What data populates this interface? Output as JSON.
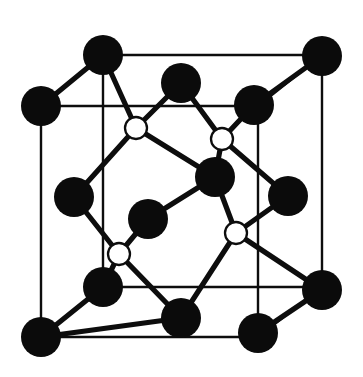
{
  "figure": {
    "background_color": "#ffffff",
    "line_color": "#0d0d0d",
    "dark_atom_color": "#0b0b0b",
    "light_atom_color": "#ffffff"
  },
  "geometry": {
    "canvas": {
      "width": 363,
      "height": 377
    },
    "cube_vertices": {
      "front_top_left": {
        "x": 41,
        "y": 106
      },
      "front_top_right": {
        "x": 258,
        "y": 106
      },
      "front_bottom_left": {
        "x": 41,
        "y": 337
      },
      "front_bottom_right": {
        "x": 258,
        "y": 337
      },
      "back_top_left": {
        "x": 103,
        "y": 55
      },
      "back_top_right": {
        "x": 322,
        "y": 55
      },
      "back_bottom_left": {
        "x": 103,
        "y": 287
      },
      "back_bottom_right": {
        "x": 322,
        "y": 287
      }
    },
    "dark_atoms": [
      {
        "name": "corner-back-top-left",
        "x": 103,
        "y": 55,
        "r": 20
      },
      {
        "name": "corner-back-top-right",
        "x": 322,
        "y": 56,
        "r": 20
      },
      {
        "name": "corner-front-top-left",
        "x": 41,
        "y": 106,
        "r": 20
      },
      {
        "name": "corner-front-bottom-left",
        "x": 41,
        "y": 337,
        "r": 20
      },
      {
        "name": "corner-back-bottom-left",
        "x": 103,
        "y": 287,
        "r": 20
      },
      {
        "name": "corner-back-bottom-right",
        "x": 322,
        "y": 290,
        "r": 20
      },
      {
        "name": "corner-front-bottom-right",
        "x": 258,
        "y": 333,
        "r": 20
      },
      {
        "name": "face-top-center",
        "x": 181,
        "y": 83,
        "r": 20
      },
      {
        "name": "face-top-right",
        "x": 254,
        "y": 105,
        "r": 20
      },
      {
        "name": "face-left-center",
        "x": 74,
        "y": 197,
        "r": 20
      },
      {
        "name": "face-right-center",
        "x": 288,
        "y": 196,
        "r": 20
      },
      {
        "name": "face-front-center",
        "x": 148,
        "y": 219,
        "r": 20
      },
      {
        "name": "face-back-center",
        "x": 215,
        "y": 177,
        "r": 20
      },
      {
        "name": "face-bottom-center",
        "x": 181,
        "y": 318,
        "r": 20
      }
    ],
    "light_atoms": [
      {
        "name": "interior-upper-left",
        "x": 136,
        "y": 128,
        "r": 11
      },
      {
        "name": "interior-upper-right",
        "x": 222,
        "y": 139,
        "r": 11
      },
      {
        "name": "interior-lower-left",
        "x": 119,
        "y": 254,
        "r": 11
      },
      {
        "name": "interior-lower-right",
        "x": 236,
        "y": 233,
        "r": 11
      }
    ],
    "bonds": [
      {
        "from": "interior-upper-left",
        "to": "corner-back-top-left"
      },
      {
        "from": "interior-upper-left",
        "to": "face-top-center"
      },
      {
        "from": "interior-upper-left",
        "to": "face-left-center"
      },
      {
        "from": "interior-upper-left",
        "to": "face-back-center"
      },
      {
        "from": "interior-upper-right",
        "to": "face-top-center"
      },
      {
        "from": "interior-upper-right",
        "to": "face-top-right"
      },
      {
        "from": "interior-upper-right",
        "to": "face-back-center"
      },
      {
        "from": "interior-upper-right",
        "to": "face-right-center"
      },
      {
        "from": "interior-lower-left",
        "to": "face-left-center"
      },
      {
        "from": "interior-lower-left",
        "to": "face-front-center"
      },
      {
        "from": "interior-lower-left",
        "to": "corner-back-bottom-left"
      },
      {
        "from": "interior-lower-left",
        "to": "face-bottom-center"
      },
      {
        "from": "interior-lower-right",
        "to": "face-back-center"
      },
      {
        "from": "interior-lower-right",
        "to": "face-right-center"
      },
      {
        "from": "interior-lower-right",
        "to": "face-bottom-center"
      },
      {
        "from": "interior-lower-right",
        "to": "corner-back-bottom-right"
      },
      {
        "from": "face-front-center",
        "to": "face-back-center"
      },
      {
        "from": "corner-back-top-left",
        "to": "corner-front-top-left"
      },
      {
        "from": "corner-back-top-right",
        "to": "face-top-right"
      },
      {
        "from": "corner-front-bottom-left",
        "to": "corner-back-bottom-left"
      },
      {
        "from": "corner-front-bottom-left",
        "to": "face-bottom-center"
      },
      {
        "from": "corner-front-bottom-right",
        "to": "corner-back-bottom-right"
      }
    ]
  }
}
